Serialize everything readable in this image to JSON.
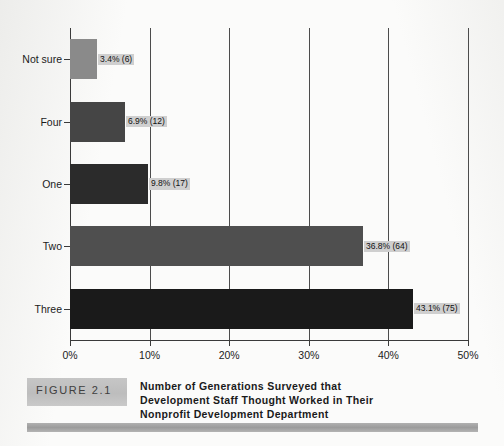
{
  "chart_data": {
    "type": "bar",
    "orientation": "horizontal",
    "title": "",
    "xlabel": "",
    "ylabel": "",
    "categories": [
      "Not sure",
      "Four",
      "One",
      "Two",
      "Three"
    ],
    "values": [
      3.4,
      6.9,
      9.8,
      36.8,
      43.1
    ],
    "counts": [
      6,
      12,
      17,
      64,
      75
    ],
    "data_labels": [
      "3.4% (6)",
      "6.9% (12)",
      "9.8% (17)",
      "36.8% (64)",
      "43.1% (75)"
    ],
    "bar_colors": [
      "#8a8a8a",
      "#454545",
      "#2b2b2b",
      "#4f4f4f",
      "#1a1a1a"
    ],
    "xlim": [
      0,
      50
    ],
    "xticks": [
      0,
      10,
      20,
      30,
      40,
      50
    ],
    "xtick_labels": [
      "0%",
      "10%",
      "20%",
      "30%",
      "40%",
      "50%"
    ],
    "grid": "vertical",
    "legend": "none"
  },
  "caption": {
    "figure_label": "FIGURE 2.1",
    "title_lines": [
      "Number of Generations Surveyed that",
      "Development Staff Thought Worked in Their",
      "Nonprofit Development Department"
    ]
  },
  "colors": {
    "page_background": "#fbfbfa",
    "axis": "#3a3a3a",
    "gridline": "#4c4c4c",
    "label_background": "#cfcfcf",
    "badge_background": "#c2c2c2",
    "rule": "#a6a6a6"
  }
}
